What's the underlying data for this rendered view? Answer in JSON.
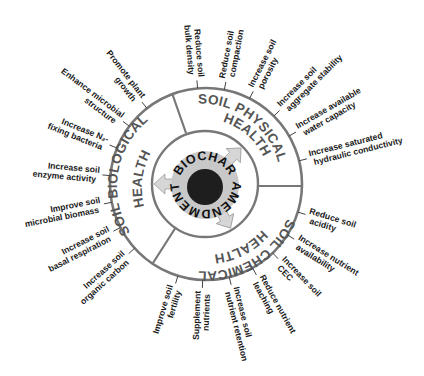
{
  "diagram": {
    "center": {
      "top_text": "BIOCHAR",
      "bottom_text": "AMENDMENT"
    },
    "sectors": [
      {
        "name": "physical",
        "line1": "SOIL PHYSICAL",
        "line2": "HEALTH"
      },
      {
        "name": "chemical",
        "line1": "SOIL CHEMICAL",
        "line2": "HEALTH"
      },
      {
        "name": "biological",
        "line1": "SOIL BIOLOGICAL",
        "line2": "HEALTH"
      }
    ],
    "benefits": [
      {
        "sector": "physical",
        "lines": [
          "Reduce soil",
          "bulk density"
        ]
      },
      {
        "sector": "physical",
        "lines": [
          "Reduce soil",
          "compaction"
        ]
      },
      {
        "sector": "physical",
        "lines": [
          "Increase soil",
          "porosity"
        ]
      },
      {
        "sector": "physical",
        "lines": [
          "Increase soil",
          "aggregate stability"
        ]
      },
      {
        "sector": "physical",
        "lines": [
          "Increase available",
          "water capacity"
        ]
      },
      {
        "sector": "physical",
        "lines": [
          "Increase saturated",
          "hydraulic conductivity"
        ]
      },
      {
        "sector": "chemical",
        "lines": [
          "Reduce soil",
          "acidity"
        ]
      },
      {
        "sector": "chemical",
        "lines": [
          "Increase nutrient",
          "availability"
        ]
      },
      {
        "sector": "chemical",
        "lines": [
          "Increase soil",
          "CEC"
        ]
      },
      {
        "sector": "chemical",
        "lines": [
          "Reduce nutrient",
          "leaching"
        ]
      },
      {
        "sector": "chemical",
        "lines": [
          "Increase soil",
          "nutrient retention"
        ]
      },
      {
        "sector": "chemical",
        "lines": [
          "Supplement",
          "nutrients"
        ]
      },
      {
        "sector": "chemical",
        "lines": [
          "Improve soil",
          "fertility"
        ]
      },
      {
        "sector": "biological",
        "lines": [
          "Increase soil",
          "organic carbon"
        ]
      },
      {
        "sector": "biological",
        "lines": [
          "Increase soil",
          "basal respiration"
        ]
      },
      {
        "sector": "biological",
        "lines": [
          "Improve soil",
          "microbial biomass"
        ]
      },
      {
        "sector": "biological",
        "lines": [
          "Increase soil",
          "enzyme activity"
        ]
      },
      {
        "sector": "biological",
        "lines": [
          "Increase N₂-",
          "fixing bacteria"
        ]
      },
      {
        "sector": "biological",
        "lines": [
          "Enhance microbial",
          "structure"
        ]
      },
      {
        "sector": "biological",
        "lines": [
          "Promote plant",
          "growth"
        ]
      }
    ],
    "colors": {
      "ring_stroke": "#777777",
      "sector_text": "#555555",
      "core_disc": "#c8c8c8",
      "biochar_core": "#1e1e1e",
      "arrow_fill": "#d6d6d6",
      "label_text": "#1a1a1a"
    }
  }
}
